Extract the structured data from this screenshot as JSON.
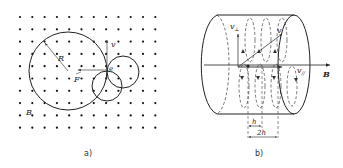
{
  "figure_a": {
    "caption": "a)",
    "labels": {
      "radius": "R",
      "velocity": "v",
      "force": "F",
      "charge": "e",
      "field": "B"
    },
    "field_direction": "out-of-page (dots)",
    "grid": {
      "columns": 12,
      "rows": 10
    }
  },
  "figure_b": {
    "caption": "b)",
    "labels": {
      "velocity": "v",
      "v_perp": "v",
      "v_perp_sub": "⊥",
      "v_par": "v",
      "v_par_sub": "//",
      "field": "B",
      "pitch": "h",
      "double_pitch": "2h"
    }
  },
  "colors": {
    "ink": "#222222",
    "background": "#ffffff"
  }
}
